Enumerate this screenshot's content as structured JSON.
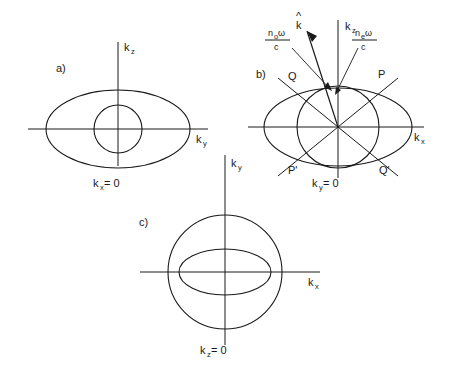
{
  "figure": {
    "stroke_color": "#1a1a1a",
    "background_color": "#ffffff"
  },
  "panels": [
    {
      "id": "a)",
      "caption": "k",
      "caption_sub": "x",
      "caption_tail": " = 0",
      "axis_vertical": {
        "label": "k",
        "sub": "z"
      },
      "axis_horizontal": {
        "label": "k",
        "sub": "y"
      },
      "curves": [
        {
          "name": "outer-ellipse",
          "type": "ellipse",
          "rx": 80,
          "ry": 42
        },
        {
          "name": "inner-circle",
          "type": "circle",
          "r": 25
        }
      ]
    },
    {
      "id": "b)",
      "caption": "k",
      "caption_sub": "y",
      "caption_tail": " = 0",
      "axis_vertical": {
        "label": "k",
        "sub": "z"
      },
      "axis_horizontal": {
        "label": "k",
        "sub": "x"
      },
      "axis_extra": {
        "label": "k",
        "sub": "y"
      },
      "wave_vector": {
        "label": "k",
        "accent": "hat"
      },
      "annotations": [
        {
          "name": "ordinary-index-label",
          "numerator": "n",
          "numerator_sub": "o",
          "numerator_tail": "ω",
          "denominator": "c"
        },
        {
          "name": "extraordinary-index-label",
          "numerator": "n",
          "numerator_sub": "e",
          "numerator_tail": "ω",
          "denominator": "c"
        }
      ],
      "points": [
        {
          "name": "point-P",
          "label": "P"
        },
        {
          "name": "point-Q",
          "label": "Q"
        },
        {
          "name": "point-P-prime",
          "label": "P'"
        },
        {
          "name": "point-Q-prime",
          "label": "Q'"
        }
      ],
      "curves": [
        {
          "name": "ellipse",
          "type": "ellipse",
          "rx": 80,
          "ry": 42
        },
        {
          "name": "circle",
          "type": "circle",
          "r": 42
        }
      ]
    },
    {
      "id": "c)",
      "caption": "k",
      "caption_sub": "z",
      "caption_tail": " = 0",
      "axis_vertical": {
        "label": "k",
        "sub": "y"
      },
      "axis_horizontal": {
        "label": "k",
        "sub": "x"
      },
      "curves": [
        {
          "name": "outer-circle",
          "type": "circle",
          "r": 62
        },
        {
          "name": "inner-ellipse",
          "type": "ellipse",
          "rx": 50,
          "ry": 25
        }
      ]
    }
  ]
}
